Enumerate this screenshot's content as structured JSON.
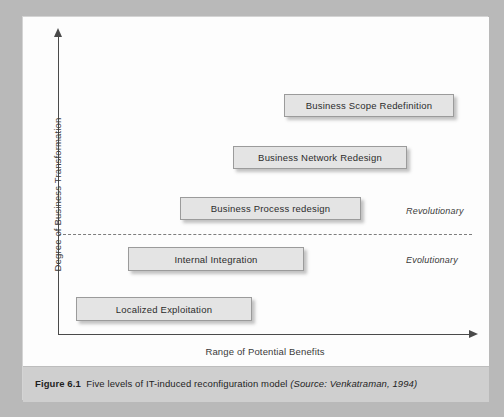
{
  "figure": {
    "caption_number": "Figure 6.1",
    "caption_body": "Five levels of IT-induced reconfiguration model",
    "caption_source": "(Source: Venkatraman, 1994)"
  },
  "axes": {
    "y_title": "Degree of Business Transformation",
    "x_title": "Range of Potential Benefits"
  },
  "zones": {
    "upper": "Revolutionary",
    "lower": "Evolutionary"
  },
  "levels": [
    {
      "label": "Business Scope Redefinition",
      "level": 5
    },
    {
      "label": "Business Network Redesign",
      "level": 4
    },
    {
      "label": "Business Process redesign",
      "level": 3
    },
    {
      "label": "Internal Integration",
      "level": 2
    },
    {
      "label": "Localized Exploitation",
      "level": 1
    }
  ],
  "colors": {
    "box_fill": "#e4e4e4",
    "box_border": "#9b9b9b",
    "axis": "#4a4a4a",
    "caption_band": "#cfcfcf",
    "page_background": "#b9b9b9",
    "panel": "#fdfdfd"
  },
  "chart_data": {
    "type": "scatter",
    "title": "Five levels of IT-induced reconfiguration model",
    "xlabel": "Range of Potential Benefits",
    "ylabel": "Degree of Business Transformation",
    "xlim": [
      0,
      100
    ],
    "ylim": [
      0,
      100
    ],
    "grid": false,
    "legend": "none",
    "categories": [
      "Localized Exploitation",
      "Internal Integration",
      "Business Process redesign",
      "Business Network Redesign",
      "Business Scope Redefinition"
    ],
    "points": [
      {
        "label": "Localized Exploitation",
        "x": 14,
        "y": 8,
        "zone": "Evolutionary"
      },
      {
        "label": "Internal Integration",
        "x": 29,
        "y": 25,
        "zone": "Evolutionary"
      },
      {
        "label": "Business Process redesign",
        "x": 46,
        "y": 42,
        "zone": "Revolutionary"
      },
      {
        "label": "Business Network Redesign",
        "x": 62,
        "y": 59,
        "zone": "Revolutionary"
      },
      {
        "label": "Business Scope Redefinition",
        "x": 78,
        "y": 76,
        "zone": "Revolutionary"
      }
    ],
    "annotations": [
      {
        "text": "Revolutionary",
        "x": 88,
        "y": 45
      },
      {
        "text": "Evolutionary",
        "x": 88,
        "y": 29
      }
    ],
    "threshold_line": {
      "orientation": "horizontal",
      "y": 34,
      "style": "dashed",
      "separates": [
        "Evolutionary",
        "Revolutionary"
      ]
    }
  },
  "layout": {
    "boxes": [
      {
        "left": 261,
        "top": 77,
        "width": 170,
        "height": 23
      },
      {
        "left": 210,
        "top": 129,
        "width": 174,
        "height": 23
      },
      {
        "left": 157,
        "top": 180,
        "width": 181,
        "height": 23
      },
      {
        "left": 105,
        "top": 230,
        "width": 176,
        "height": 24
      },
      {
        "left": 53,
        "top": 280,
        "width": 176,
        "height": 24
      }
    ]
  }
}
